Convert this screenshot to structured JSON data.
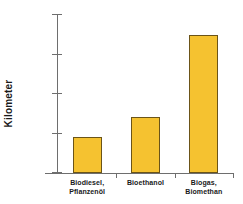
{
  "chart_data": {
    "type": "bar",
    "title": "",
    "xlabel": "",
    "ylabel": "Kilometer",
    "categories": [
      "Biodiesel, Pflanzenöl",
      "Bioethanol",
      "Biogas, Biomethan"
    ],
    "category_lines": [
      [
        "Biodiesel,",
        "Pflanzenöl"
      ],
      [
        "Bioethanol",
        ""
      ],
      [
        "Biogas,",
        "Biomethan"
      ]
    ],
    "values": [
      18000,
      28500,
      70000
    ],
    "ylim": [
      0,
      80000
    ],
    "ytick_values": [
      0,
      20000,
      40000,
      60000,
      80000
    ],
    "ytick_labels": [
      "0",
      "20.000",
      "40.000",
      "60.000",
      "80.000"
    ],
    "grid": false,
    "legend": null,
    "bar_fill_color": "#F5C230",
    "bar_border_color": "#6B5418",
    "axis_color": "#6E6E6E",
    "background_color": "#FFFFFF",
    "text_color": "#1A1A1A"
  }
}
